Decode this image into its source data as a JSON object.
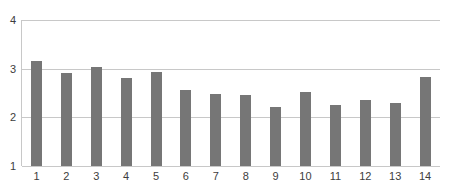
{
  "chart_data": {
    "type": "bar",
    "title": "",
    "subtitle": "",
    "xlabel": "",
    "ylabel": "",
    "categories": [
      "1",
      "2",
      "3",
      "4",
      "5",
      "6",
      "7",
      "8",
      "9",
      "10",
      "11",
      "12",
      "13",
      "14"
    ],
    "values": [
      3.15,
      2.92,
      3.03,
      2.8,
      2.93,
      2.57,
      2.49,
      2.46,
      2.21,
      2.53,
      2.26,
      2.35,
      2.29,
      2.82
    ],
    "series": [
      {
        "name": "",
        "values": [
          3.15,
          2.92,
          3.03,
          2.8,
          2.93,
          2.57,
          2.49,
          2.46,
          2.21,
          2.53,
          2.26,
          2.35,
          2.29,
          2.82
        ]
      }
    ],
    "ylim": [
      1,
      4
    ],
    "xlim": [
      0.5,
      14.5
    ],
    "y_ticks": [
      "1",
      "2",
      "3",
      "4"
    ],
    "y_tick_values": [
      1,
      2,
      3,
      4
    ],
    "x_ticks": [
      "1",
      "2",
      "3",
      "4",
      "5",
      "6",
      "7",
      "8",
      "9",
      "10",
      "11",
      "12",
      "13",
      "14"
    ],
    "grid": "horizontal",
    "legend": "none",
    "bar_color": "#767676",
    "grid_color": "#c8c8c8",
    "axis_color": "#c8c8c8",
    "tick_label_color": "#3d3d3d",
    "background_color": "#ffffff"
  }
}
